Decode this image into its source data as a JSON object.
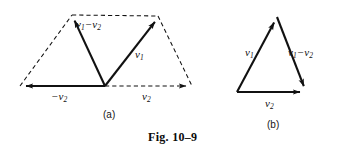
{
  "figure": {
    "caption": "Fig. 10–9",
    "background_color": "#ffffff",
    "ink_color": "#111111",
    "panels": [
      {
        "id": "a",
        "sub_label": "(a)",
        "description": "Parallelogram construction showing vector subtraction v1 minus v2 as the sum of v1 and negative v2",
        "labels": {
          "difference": {
            "base": "v",
            "sub1": "1",
            "operator": "−",
            "base2": "v",
            "sub2": "2",
            "text": "v1 − v2"
          },
          "v1": {
            "base": "v",
            "sub1": "1",
            "text": "v1"
          },
          "neg_v2": {
            "operator": "−",
            "base": "v",
            "sub1": "2",
            "text": "−v2"
          },
          "v2": {
            "base": "v",
            "sub1": "2",
            "text": "v2"
          }
        },
        "geometry": {
          "origin": [
            105,
            86
          ],
          "left_apex": [
            72,
            15
          ],
          "right_apex": [
            158,
            16
          ],
          "left_tail": [
            20,
            86
          ],
          "right_tail": [
            192,
            86
          ],
          "solid_arrows": [
            {
              "name": "neg-v2-arrow",
              "from": [
                105,
                86
              ],
              "to": [
                20,
                86
              ],
              "style": "solid"
            },
            {
              "name": "v1-minus-v2-arrow",
              "from": [
                105,
                86
              ],
              "to": [
                72,
                15
              ],
              "style": "solid"
            },
            {
              "name": "v1-arrow",
              "from": [
                105,
                86
              ],
              "to": [
                158,
                16
              ],
              "style": "solid"
            }
          ],
          "dashed_edges": [
            {
              "name": "v2-dashed-arrow",
              "from": [
                105,
                86
              ],
              "to": [
                192,
                86
              ],
              "style": "dashed",
              "arrowhead": true
            },
            {
              "name": "left-side-dashed",
              "from": [
                20,
                86
              ],
              "to": [
                72,
                15
              ],
              "style": "dashed",
              "arrowhead": false
            },
            {
              "name": "top-dashed",
              "from": [
                72,
                15
              ],
              "to": [
                158,
                16
              ],
              "style": "dashed",
              "arrowhead": false
            },
            {
              "name": "right-side-dashed",
              "from": [
                158,
                16
              ],
              "to": [
                192,
                86
              ],
              "style": "dashed",
              "arrowhead": false
            }
          ]
        }
      },
      {
        "id": "b",
        "sub_label": "(b)",
        "description": "Triangle form of the same subtraction: v2 plus (v1 minus v2) equals v1",
        "labels": {
          "v1": {
            "base": "v",
            "sub1": "1",
            "text": "v1"
          },
          "difference": {
            "base": "v",
            "sub1": "1",
            "operator": "−",
            "base2": "v",
            "sub2": "2",
            "text": "v1 − v2"
          },
          "v2": {
            "base": "v",
            "sub1": "2",
            "text": "v2"
          }
        },
        "geometry": {
          "bottom_left": [
            237,
            92
          ],
          "bottom_right": [
            306,
            92
          ],
          "apex": [
            277,
            17
          ],
          "solid_arrows": [
            {
              "name": "v1-arrow",
              "from": [
                237,
                92
              ],
              "to": [
                277,
                17
              ],
              "style": "solid"
            },
            {
              "name": "v1-minus-v2-arrow",
              "from": [
                277,
                17
              ],
              "to": [
                306,
                92
              ],
              "style": "solid"
            },
            {
              "name": "v2-arrow",
              "from": [
                237,
                92
              ],
              "to": [
                306,
                92
              ],
              "style": "solid"
            }
          ]
        }
      }
    ]
  }
}
